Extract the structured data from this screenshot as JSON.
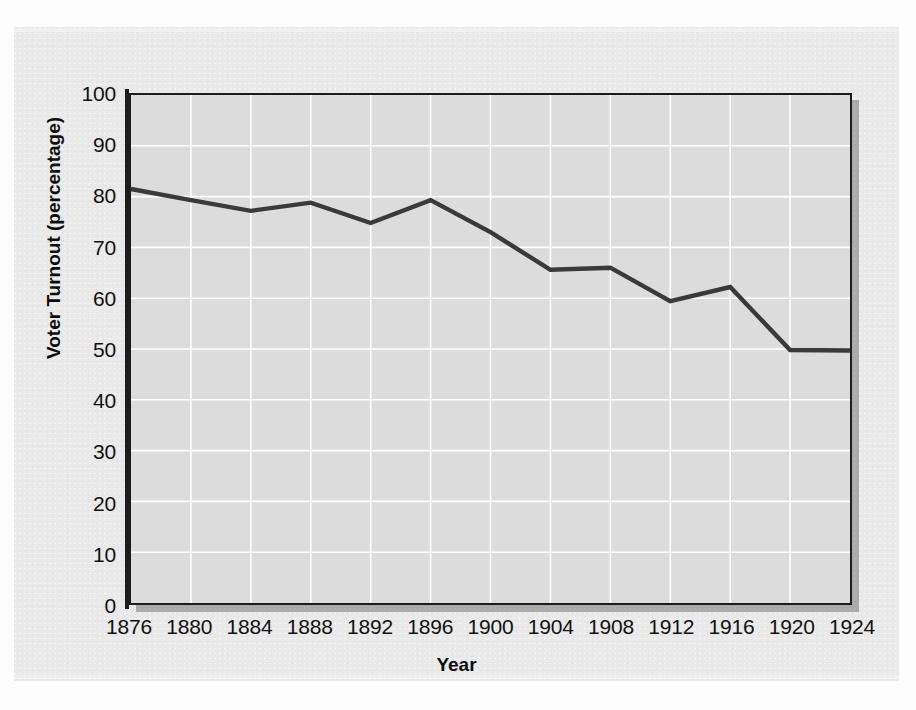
{
  "chart_data": {
    "type": "line",
    "title": "",
    "xlabel": "Year",
    "ylabel": "Voter Turnout (percentage)",
    "xlim": [
      1876,
      1924
    ],
    "ylim": [
      0,
      100
    ],
    "grid": true,
    "legend": "none",
    "x": [
      1876,
      1880,
      1884,
      1888,
      1892,
      1896,
      1900,
      1904,
      1908,
      1912,
      1916,
      1920,
      1924
    ],
    "values": [
      81.5,
      79.3,
      77.2,
      78.8,
      74.8,
      79.3,
      73.0,
      65.6,
      66.0,
      59.4,
      62.2,
      49.8,
      49.7
    ],
    "x_tick_labels": [
      "1876",
      "1880",
      "1884",
      "1888",
      "1892",
      "1896",
      "1900",
      "1904",
      "1908",
      "1912",
      "1916",
      "1920",
      "1924"
    ],
    "y_tick_labels": [
      "0",
      "10",
      "20",
      "30",
      "40",
      "50",
      "60",
      "70",
      "80",
      "90",
      "100"
    ],
    "y_ticks": [
      0,
      10,
      20,
      30,
      40,
      50,
      60,
      70,
      80,
      90,
      100
    ],
    "series_name": "Voter Turnout",
    "series_color": "#3a3a3a",
    "plot_background": "#dcdcdc",
    "gridline_color": "#ffffff",
    "axis_color": "#1c1c1c",
    "page_background": "#e9e9e9"
  }
}
